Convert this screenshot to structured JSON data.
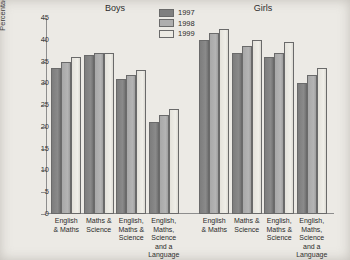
{
  "chart_data": {
    "type": "bar",
    "title": "",
    "xlabel": "",
    "ylabel": "Percentage of 15 year old pupils",
    "ylim": [
      0,
      45
    ],
    "yticks": [
      0,
      5,
      10,
      15,
      20,
      25,
      30,
      35,
      40,
      45
    ],
    "grid": false,
    "legend_position": "top-center",
    "categories": [
      "English\n& Maths",
      "Maths &\nScience",
      "English,\nMaths &\nScience",
      "English,\nMaths,\nScience\nand a\nLanguage"
    ],
    "panels": [
      {
        "name": "Boys",
        "series": [
          {
            "name": "1997",
            "color": "#7f7f7f",
            "values": [
              33.5,
              36.5,
              31.0,
              21.2
            ]
          },
          {
            "name": "1998",
            "color": "#aeaeae",
            "values": [
              35.0,
              37.0,
              32.0,
              22.8
            ]
          },
          {
            "name": "1999",
            "color": "#eceae3",
            "values": [
              36.0,
              37.0,
              33.0,
              24.0
            ]
          }
        ]
      },
      {
        "name": "Girls",
        "series": [
          {
            "name": "1997",
            "color": "#7f7f7f",
            "values": [
              40.0,
              37.0,
              36.0,
              30.0
            ]
          },
          {
            "name": "1998",
            "color": "#aeaeae",
            "values": [
              41.5,
              38.5,
              37.0,
              32.0
            ]
          },
          {
            "name": "1999",
            "color": "#eceae3",
            "values": [
              42.5,
              40.0,
              39.5,
              33.5
            ]
          }
        ]
      }
    ],
    "legend": [
      {
        "label": "1997",
        "color": "#7f7f7f"
      },
      {
        "label": "1998",
        "color": "#aeaeae"
      },
      {
        "label": "1999",
        "color": "#eceae3"
      }
    ]
  },
  "panel_titles": {
    "boys": "Boys",
    "girls": "Girls"
  },
  "axis": {
    "y_title": "Percentage of 15 year old pupils",
    "tick_labels": [
      "45",
      "40",
      "35",
      "30",
      "25",
      "20",
      "15",
      "10",
      "5",
      "0"
    ]
  }
}
